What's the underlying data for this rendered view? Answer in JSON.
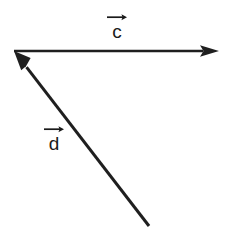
{
  "figure": {
    "background_color": "#ffffff",
    "stroke_color": "#1f1f1f",
    "width": 229,
    "height": 236
  },
  "labels": {
    "c": {
      "letter": "c",
      "overarrow": "right-arrow-accent",
      "x": 104,
      "y": 12
    },
    "d": {
      "letter": "d",
      "overarrow": "right-arrow-accent",
      "x": 41,
      "y": 124
    }
  },
  "vectors": [
    {
      "name": "c",
      "label": "c",
      "direction": "right",
      "tail": {
        "x": 14,
        "y": 51
      },
      "tip": {
        "x": 219,
        "y": 51
      },
      "line_width": 2,
      "arrowhead": "filled-triangle",
      "color": "#1f1f1f"
    },
    {
      "name": "d",
      "label": "d",
      "direction": "up-left",
      "tail": {
        "x": 149,
        "y": 226
      },
      "tip": {
        "x": 14,
        "y": 51
      },
      "line_width": 3,
      "arrowhead": "filled-triangle",
      "color": "#1f1f1f"
    }
  ]
}
